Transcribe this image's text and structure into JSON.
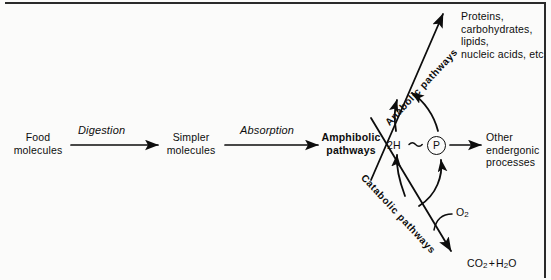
{
  "diagram": {
    "nodes": {
      "food": "Food\nmolecules",
      "simpler": "Simpler\nmolecules",
      "amphibolic": "Amphibolic\npathways",
      "macromolecules": "Proteins,\ncarbohydrates,\nlipids,\nnucleic acids, etc",
      "endergonic": "Other\nendergonic\nprocesses",
      "reducing_equivalents": "2H",
      "phosphate": "P",
      "oxygen_element": "O",
      "oxygen_sub": "2",
      "waste": "CO2 + H2O"
    },
    "arrow_labels": {
      "digestion": "Digestion",
      "absorption": "Absorption",
      "anabolic": "Anabolic pathways",
      "catabolic": "Catabolic pathways"
    },
    "colors": {
      "ink": "#0d0d0d",
      "background": "#fbfbfa",
      "rule": "#2a2a2a"
    }
  }
}
